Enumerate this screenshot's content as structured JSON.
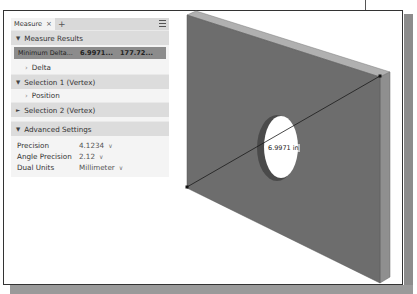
{
  "panel": {
    "tab_label": "Measure",
    "tab_close": "×",
    "tab_add": "+",
    "sections": {
      "measure_results": {
        "label": "Measure Results",
        "expanded": true
      },
      "selection1": {
        "label": "Selection 1 (Vertex)",
        "expanded": true
      },
      "selection2": {
        "label": "Selection 2 (Vertex)",
        "expanded": false
      },
      "advanced": {
        "label": "Advanced Settings",
        "expanded": true
      }
    },
    "result": {
      "label": "Minimum Delta...",
      "value1": "6.9971...",
      "value2": "177.72..."
    },
    "delta_label": "Delta",
    "position_label": "Position",
    "settings": [
      {
        "label": "Precision",
        "value": "4.1234"
      },
      {
        "label": "Angle Precision",
        "value": "2.12"
      },
      {
        "label": "Dual Units",
        "value": "Millimeter"
      }
    ],
    "expanded_glyph": "▼",
    "collapsed_glyph": "►",
    "chevron_glyph": "›",
    "dropdown_glyph": "∨"
  },
  "viewport": {
    "dimension_label": "6.9971 in",
    "colors": {
      "plate_face": "#6e6e6e",
      "plate_top": "#a8a8a8",
      "plate_side": "#8d8d8d",
      "hole": "#ffffff"
    }
  }
}
